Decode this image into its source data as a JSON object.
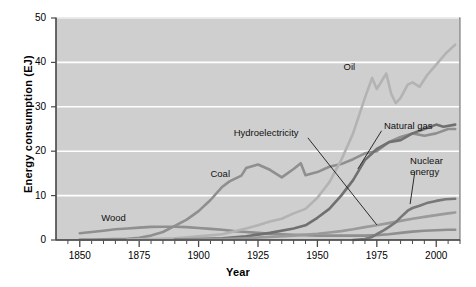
{
  "chart_data": {
    "type": "line",
    "title": "",
    "xlabel": "Year",
    "ylabel": "Energy consumption (EJ)",
    "xlim": [
      1840,
      2010
    ],
    "ylim": [
      0,
      50
    ],
    "xticks": [
      1850,
      1875,
      1900,
      1925,
      1950,
      1975,
      2000
    ],
    "yticks": [
      0,
      10,
      20,
      30,
      40,
      50
    ],
    "xminor_step": 5,
    "grid": "horizontal-white-gridlines",
    "legend": "inline-annotations",
    "plot_background": "#cfcfcf",
    "series": [
      {
        "name": "Wood",
        "color": "#8f8f8f",
        "label_x": 1859,
        "label_y": 5.0,
        "x": [
          1850,
          1855,
          1860,
          1865,
          1870,
          1875,
          1880,
          1885,
          1890,
          1895,
          1900,
          1905,
          1910,
          1915,
          1920,
          1925,
          1930,
          1935,
          1940,
          1945,
          1950,
          1955,
          1960,
          1965,
          1970,
          1975,
          1980,
          1985,
          1990,
          1995,
          2000,
          2005,
          2008
        ],
        "values": [
          1.5,
          1.8,
          2.1,
          2.4,
          2.6,
          2.8,
          2.95,
          3.0,
          3.0,
          2.9,
          2.7,
          2.5,
          2.3,
          2.0,
          1.8,
          1.6,
          1.4,
          1.3,
          1.2,
          1.1,
          1.0,
          1.0,
          1.0,
          1.0,
          1.0,
          1.1,
          1.3,
          1.6,
          1.9,
          2.1,
          2.2,
          2.3,
          2.3
        ]
      },
      {
        "name": "Coal",
        "color": "#8f8f8f",
        "label_x": 1905,
        "label_y": 14.8,
        "x": [
          1850,
          1855,
          1860,
          1865,
          1870,
          1875,
          1880,
          1885,
          1890,
          1895,
          1900,
          1905,
          1910,
          1913,
          1918,
          1920,
          1925,
          1930,
          1935,
          1940,
          1943,
          1945,
          1950,
          1955,
          1960,
          1965,
          1970,
          1975,
          1980,
          1985,
          1990,
          1995,
          2000,
          2005,
          2008
        ],
        "values": [
          0.1,
          0.1,
          0.15,
          0.2,
          0.3,
          0.5,
          1.0,
          1.8,
          3.2,
          4.6,
          6.5,
          9.0,
          12.0,
          13.2,
          14.5,
          16.2,
          17.0,
          15.8,
          14.1,
          16.0,
          17.3,
          14.6,
          15.3,
          16.5,
          17.1,
          18.2,
          19.5,
          20.0,
          22.0,
          23.2,
          24.0,
          23.5,
          24.0,
          25.0,
          25.0
        ]
      },
      {
        "name": "Oil",
        "color": "#b3b3b3",
        "label_x": 1961,
        "label_y": 39.0,
        "x": [
          1870,
          1880,
          1890,
          1900,
          1910,
          1920,
          1925,
          1930,
          1935,
          1940,
          1945,
          1950,
          1955,
          1960,
          1965,
          1970,
          1973,
          1975,
          1979,
          1981,
          1983,
          1985,
          1988,
          1990,
          1993,
          1996,
          2000,
          2004,
          2008
        ],
        "values": [
          0.1,
          0.2,
          0.4,
          0.8,
          1.3,
          2.6,
          3.3,
          4.2,
          4.8,
          6.0,
          7.0,
          9.5,
          13.0,
          18.0,
          24.0,
          32.0,
          36.5,
          34.0,
          37.5,
          33.0,
          30.8,
          32.0,
          35.0,
          35.5,
          34.5,
          37.0,
          39.5,
          42.0,
          44.0
        ]
      },
      {
        "name": "Natural gas",
        "color": "#707070",
        "label_x": 1978,
        "label_y": 25.6,
        "x": [
          1890,
          1900,
          1910,
          1920,
          1930,
          1940,
          1945,
          1950,
          1955,
          1960,
          1965,
          1970,
          1975,
          1980,
          1985,
          1990,
          1995,
          2000,
          2003,
          2008
        ],
        "values": [
          0.1,
          0.2,
          0.4,
          0.8,
          1.6,
          2.6,
          3.3,
          5.0,
          7.0,
          10.0,
          13.5,
          18.0,
          20.5,
          22.0,
          22.5,
          24.0,
          25.0,
          26.0,
          25.5,
          26.0
        ]
      },
      {
        "name": "Hydroelectricity",
        "color": "#9a9a9a",
        "label_x": 1940,
        "label_y": 24.0,
        "x": [
          1890,
          1900,
          1910,
          1920,
          1930,
          1940,
          1950,
          1955,
          1960,
          1965,
          1970,
          1975,
          1980,
          1985,
          1990,
          1995,
          2000,
          2005,
          2008
        ],
        "values": [
          0.05,
          0.1,
          0.2,
          0.4,
          0.7,
          1.0,
          1.4,
          1.7,
          2.0,
          2.4,
          2.9,
          3.3,
          3.8,
          4.3,
          4.8,
          5.2,
          5.6,
          6.0,
          6.2
        ]
      },
      {
        "name": "Nuclear energy",
        "color": "#787878",
        "label_x": 1989,
        "label_y": 16.5,
        "x": [
          1965,
          1970,
          1973,
          1975,
          1978,
          1980,
          1983,
          1985,
          1988,
          1990,
          1993,
          1996,
          2000,
          2004,
          2008
        ],
        "values": [
          0.0,
          0.2,
          0.7,
          1.3,
          2.2,
          2.9,
          4.0,
          5.1,
          6.6,
          7.2,
          7.7,
          8.3,
          8.8,
          9.2,
          9.3
        ]
      }
    ]
  },
  "labels": {
    "wood": "Wood",
    "coal": "Coal",
    "oil": "Oil",
    "natural_gas": "Natural gas",
    "hydroelectricity": "Hydroelectricity",
    "nuclear_line1": "Nuclear",
    "nuclear_line2": "energy"
  }
}
